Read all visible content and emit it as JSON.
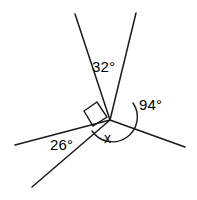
{
  "figure": {
    "type": "angle-diagram",
    "background_color": "#ffffff",
    "stroke_color": "#1a1a1a",
    "text_color": "#000000",
    "vertex": {
      "x": 110,
      "y": 120
    },
    "rays": [
      {
        "name": "ray-upper-left",
        "x1": 110,
        "y1": 120,
        "x2": 75,
        "y2": 14
      },
      {
        "name": "ray-upper-right",
        "x1": 110,
        "y1": 120,
        "x2": 136,
        "y2": 13
      },
      {
        "name": "ray-left",
        "x1": 110,
        "y1": 120,
        "x2": 15,
        "y2": 145
      },
      {
        "name": "ray-lower-left",
        "x1": 110,
        "y1": 120,
        "x2": 32,
        "y2": 187
      },
      {
        "name": "ray-right",
        "x1": 110,
        "y1": 120,
        "x2": 185,
        "y2": 147
      }
    ],
    "markers": {
      "right_angle_square": {
        "name": "right-angle-marker",
        "points": "84,111 97,102 107,117 93,126"
      },
      "arc": {
        "name": "angle-arc",
        "path": "M 133 103 A 22 22 0 1 1 92 131"
      }
    },
    "labels": [
      {
        "id": "label-32",
        "name": "angle-label-32",
        "text": "32°",
        "value": 32,
        "unit": "degrees"
      },
      {
        "id": "label-94",
        "name": "angle-label-94",
        "text": "94°",
        "value": 94,
        "unit": "degrees"
      },
      {
        "id": "label-26",
        "name": "angle-label-26",
        "text": "26°",
        "value": 26,
        "unit": "degrees"
      },
      {
        "id": "label-x",
        "name": "angle-label-x",
        "text": "x",
        "value": null,
        "unit": "unknown"
      }
    ]
  }
}
